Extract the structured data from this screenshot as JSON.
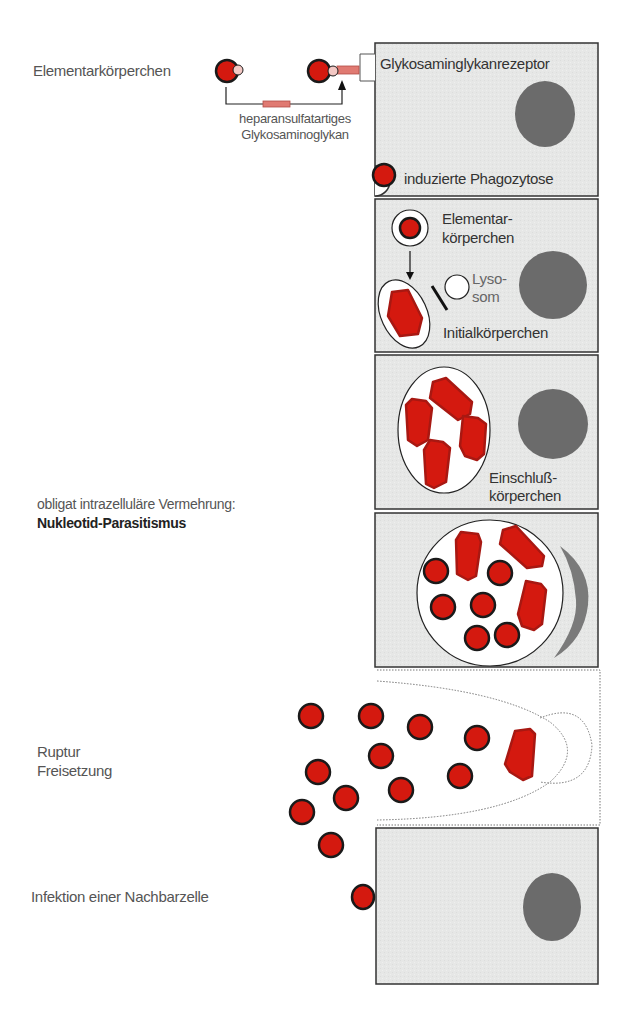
{
  "colors": {
    "cell_fill": "#e6e7e6",
    "cell_border": "#333333",
    "nucleus": "#6b6b6b",
    "body_red": "#d4190f",
    "body_outline": "#1a1a1a",
    "ligand": "#e07a72",
    "label_gray": "#555555"
  },
  "left_labels": {
    "elementary_bodies": "Elementarkörperchen",
    "glycan_line1": "heparansulfatartiges",
    "glycan_line2": "Glykosaminoglykan",
    "replication": "obligat intrazelluläre Vermehrung:",
    "parasitism": "Nukleotid-Parasitismus",
    "rupture": "Ruptur",
    "release": "Freisetzung",
    "infection": "Infektion einer Nachbarzelle"
  },
  "panels": [
    {
      "id": "attachment",
      "labels": {
        "receptor": "Glykosaminglykanrezeptor",
        "phagocytosis": "induzierte Phagozytose"
      }
    },
    {
      "id": "transformation",
      "labels": {
        "eb_line1": "Elementar-",
        "eb_line2": "körperchen",
        "lyso_line1": "Lyso-",
        "lyso_line2": "som",
        "initial": "Initialkörperchen"
      }
    },
    {
      "id": "inclusion",
      "labels": {
        "inc_line1": "Einschluß-",
        "inc_line2": "körperchen"
      }
    },
    {
      "id": "redifferentiation",
      "labels": {}
    },
    {
      "id": "rupture",
      "labels": {}
    },
    {
      "id": "new-cell",
      "labels": {}
    }
  ]
}
